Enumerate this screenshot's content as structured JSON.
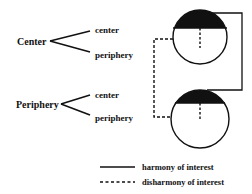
{
  "diagram": {
    "colors": {
      "ink": "#111111",
      "background": "#ffffff"
    },
    "groups": [
      {
        "label": "Center",
        "branches": [
          "center",
          "periphery"
        ]
      },
      {
        "label": "Periphery",
        "branches": [
          "center",
          "periphery"
        ]
      }
    ],
    "nodes": [
      {
        "id": "top-circle",
        "shape": "circle-with-black-cap"
      },
      {
        "id": "bottom-circle",
        "shape": "circle-with-black-cap"
      }
    ],
    "connectors": [
      {
        "from": "top-circle",
        "to": "bottom-circle",
        "style": "solid",
        "side": "right"
      },
      {
        "from": "top-circle",
        "to": "bottom-circle",
        "style": "dashed",
        "side": "left"
      }
    ],
    "legend": [
      {
        "style": "solid",
        "label": "harmony of interest"
      },
      {
        "style": "dashed",
        "label": "disharmony of interest"
      }
    ]
  }
}
